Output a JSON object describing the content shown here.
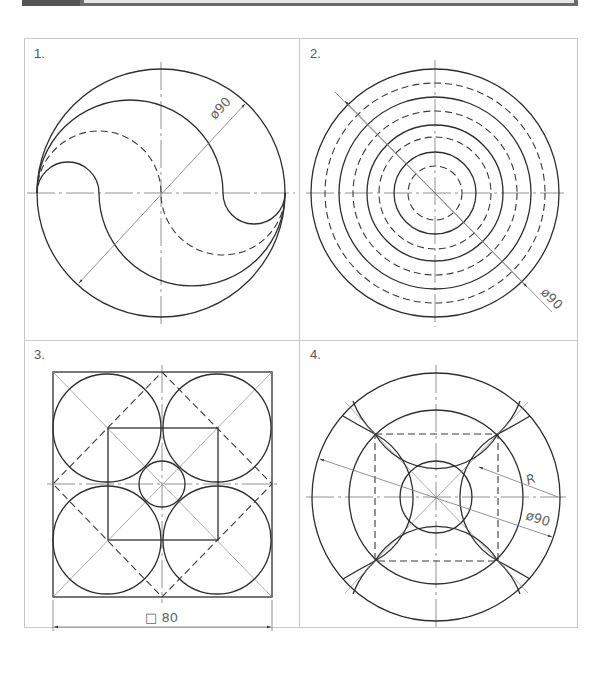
{
  "banner": {
    "color": "#6b6b6b"
  },
  "panels": [
    {
      "number": "1.",
      "dimension": "ø90"
    },
    {
      "number": "2.",
      "dimension": "ø90"
    },
    {
      "number": "3.",
      "dimension": "□ 80"
    },
    {
      "number": "4.",
      "dimension_diameter": "ø90",
      "dimension_radius": "R"
    }
  ],
  "colors": {
    "line": "#2e2e2e",
    "frame": "#c8c8c8",
    "text": "#555555"
  }
}
